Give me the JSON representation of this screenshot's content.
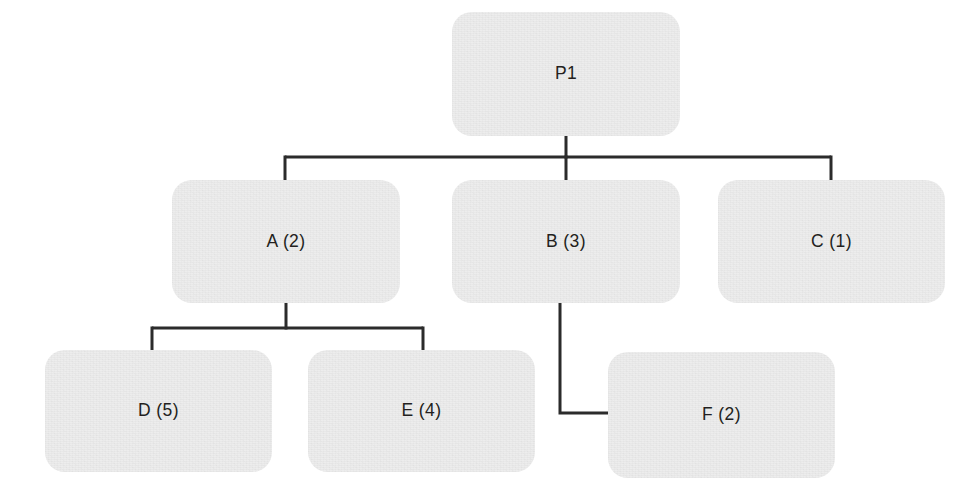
{
  "diagram": {
    "type": "tree-hierarchy",
    "orientation": "top-down",
    "background_color": "#ffffff",
    "node_fill_color": "#ededed",
    "node_text_color": "#231f20",
    "edge_color": "#2b2b2b",
    "edge_width_px": 3,
    "node_corner_radius_px": 20,
    "nodes": [
      {
        "id": "P1",
        "label": "P1",
        "level": 0,
        "x": 452,
        "y": 12,
        "w": 228,
        "h": 124
      },
      {
        "id": "A",
        "label": "A (2)",
        "level": 1,
        "x": 172,
        "y": 180,
        "w": 228,
        "h": 123
      },
      {
        "id": "B",
        "label": "B (3)",
        "level": 1,
        "x": 452,
        "y": 180,
        "w": 228,
        "h": 123
      },
      {
        "id": "C",
        "label": "C (1)",
        "level": 1,
        "x": 718,
        "y": 180,
        "w": 227,
        "h": 123
      },
      {
        "id": "D",
        "label": "D (5)",
        "level": 2,
        "x": 45,
        "y": 350,
        "w": 227,
        "h": 122
      },
      {
        "id": "E",
        "label": "E (4)",
        "level": 2,
        "x": 308,
        "y": 350,
        "w": 227,
        "h": 122
      },
      {
        "id": "F",
        "label": "F (2)",
        "level": 2,
        "x": 608,
        "y": 352,
        "w": 227,
        "h": 126
      }
    ],
    "edges": [
      {
        "id": "p1-a",
        "from": "P1",
        "to": "A",
        "style": "orthogonal-elbow"
      },
      {
        "id": "p1-b",
        "from": "P1",
        "to": "B",
        "style": "orthogonal-straight"
      },
      {
        "id": "p1-c",
        "from": "P1",
        "to": "C",
        "style": "orthogonal-elbow"
      },
      {
        "id": "a-d",
        "from": "A",
        "to": "D",
        "style": "orthogonal-elbow"
      },
      {
        "id": "a-e",
        "from": "A",
        "to": "E",
        "style": "orthogonal-elbow"
      },
      {
        "id": "b-f",
        "from": "B",
        "to": "F",
        "style": "orthogonal-side-entry"
      }
    ],
    "edge_geometry": {
      "p1_stub": {
        "x": 566,
        "y1": 136,
        "y2": 157
      },
      "p1_bus": {
        "y": 157,
        "x1": 285,
        "x2": 831
      },
      "drop_a": {
        "x": 285,
        "y1": 157,
        "y2": 180
      },
      "drop_b": {
        "x": 566,
        "y1": 157,
        "y2": 180
      },
      "drop_c": {
        "x": 831,
        "y1": 157,
        "y2": 180
      },
      "a_stub": {
        "x": 286,
        "y1": 303,
        "y2": 328
      },
      "a_bus": {
        "y": 328,
        "x1": 152,
        "x2": 423
      },
      "drop_d": {
        "x": 152,
        "y1": 328,
        "y2": 350
      },
      "drop_e": {
        "x": 423,
        "y1": 328,
        "y2": 350
      },
      "b_drop": {
        "x": 560,
        "y1": 303,
        "y2": 413
      },
      "b_to_f": {
        "y": 413,
        "x1": 560,
        "x2": 609
      }
    }
  }
}
